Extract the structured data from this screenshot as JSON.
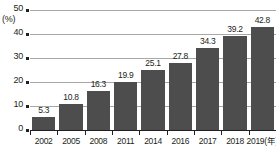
{
  "chart_data": {
    "type": "bar",
    "title": "",
    "subtitle": "",
    "xlabel": "(年)",
    "ylabel": "(%)",
    "categories": [
      "2002",
      "2005",
      "2008",
      "2011",
      "2014",
      "2016",
      "2017",
      "2018",
      "2019(年)"
    ],
    "values": [
      5.3,
      10.8,
      16.3,
      19.9,
      25.1,
      27.8,
      34.3,
      39.2,
      42.8
    ],
    "value_labels": [
      "5.3",
      "10.8",
      "16.3",
      "19.9",
      "25.1",
      "27.8",
      "34.3",
      "39.2",
      "42.8"
    ],
    "ylim": [
      0,
      50
    ],
    "yticks": [
      0,
      10,
      20,
      30,
      40,
      50
    ],
    "ytick_labels": [
      "0",
      "10",
      "20",
      "30",
      "40",
      "50"
    ],
    "grid": true,
    "legend": "none",
    "bar_color": "#4d4d4d",
    "gridline_color": "#a8a8a8",
    "axis_color": "#231f20",
    "text_color": "#231f20"
  }
}
